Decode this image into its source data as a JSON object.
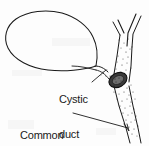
{
  "figure": {
    "type": "medical-anatomical-line-drawing",
    "background_color": "#fdfdfd",
    "ink_color": "#1a1a1a",
    "stipple_color": "#555555",
    "stone_color": "#2b2b2b"
  },
  "labels": {
    "cystic_duct": {
      "line1": "Cystic",
      "line2": "duct"
    },
    "common_bile_duct": {
      "line1": "Common",
      "line2": "bile duct"
    }
  },
  "structures": [
    {
      "name": "gallbladder",
      "description": "large oval sac, upper left, drawn as thin outline"
    },
    {
      "name": "gallbladder-neck",
      "description": "tapering neck at lower right of sac"
    },
    {
      "name": "cystic-duct",
      "description": "short stippled duct joining the common hepatic duct"
    },
    {
      "name": "impacted-stone",
      "description": "dark ovoid mass within the cystic duct junction"
    },
    {
      "name": "right-hepatic-duct",
      "description": "upper right branch of the Y"
    },
    {
      "name": "left-hepatic-duct",
      "description": "upper left branch of the Y"
    },
    {
      "name": "common-hepatic-duct",
      "description": "vertical duct below the Y bifurcation"
    },
    {
      "name": "common-bile-duct",
      "description": "stippled duct descending to lower right"
    },
    {
      "name": "cystic-duct-leader-line",
      "description": "short diagonal pointer from label up to the cystic duct"
    },
    {
      "name": "common-bile-duct-leader-line",
      "description": "long horizontal pointer with arrowhead to the common bile duct"
    }
  ]
}
